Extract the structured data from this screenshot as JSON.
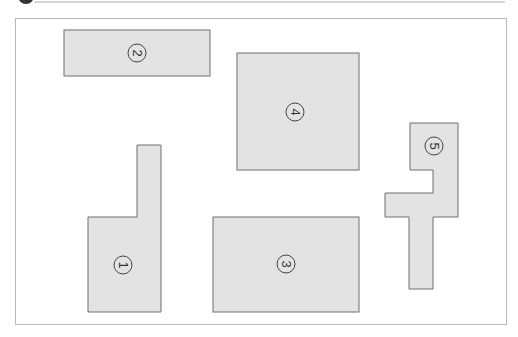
{
  "diagram": {
    "colors": {
      "background": "#ffffff",
      "frame_stroke": "#b8b8b8",
      "shape_fill": "#e3e3e3",
      "shape_stroke": "#6e6e6e",
      "label_stroke": "#444444",
      "header_dot": "#333333",
      "header_line": "#c8c8c8"
    },
    "label_rotation_deg": 90,
    "shapes": [
      {
        "id": "1",
        "label": "1",
        "type": "L-shape",
        "label_x": 123,
        "label_y": 265
      },
      {
        "id": "2",
        "label": "2",
        "type": "rectangle",
        "label_x": 137,
        "label_y": 53
      },
      {
        "id": "3",
        "label": "3",
        "type": "rectangle",
        "label_x": 286,
        "label_y": 264
      },
      {
        "id": "4",
        "label": "4",
        "type": "square",
        "label_x": 295,
        "label_y": 112
      },
      {
        "id": "5",
        "label": "5",
        "type": "T-shape",
        "label_x": 434,
        "label_y": 146
      }
    ]
  }
}
